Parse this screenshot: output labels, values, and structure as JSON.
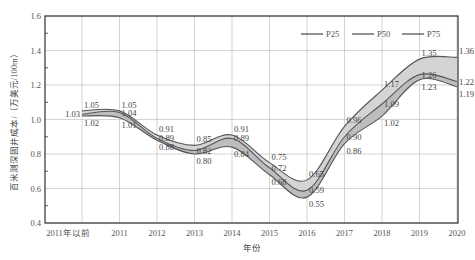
{
  "chart_data": {
    "type": "area",
    "title": "",
    "xlabel": "年份",
    "ylabel": "百米测深固井成本/（万美元/100m）",
    "categories": [
      "2011年以前",
      "2011",
      "2012",
      "2013",
      "2014",
      "2015",
      "2016",
      "2017",
      "2018",
      "2019",
      "2020"
    ],
    "series": [
      {
        "name": "P25",
        "values": [
          1.02,
          1.01,
          0.88,
          0.8,
          0.84,
          0.68,
          0.55,
          0.86,
          1.02,
          1.23,
          1.19
        ]
      },
      {
        "name": "P50",
        "values": [
          1.03,
          1.04,
          0.89,
          0.82,
          0.89,
          0.72,
          0.59,
          0.9,
          1.09,
          1.26,
          1.22
        ]
      },
      {
        "name": "P75",
        "values": [
          1.05,
          1.05,
          0.91,
          0.85,
          0.91,
          0.75,
          0.65,
          0.96,
          1.17,
          1.35,
          1.36
        ]
      }
    ],
    "ylim": [
      0.4,
      1.6
    ],
    "yticks": [
      "0.4",
      "0.6",
      "0.8",
      "1.0",
      "1.2",
      "1.4",
      "1.6"
    ],
    "grid": true,
    "legend_position": "top-right"
  },
  "legend": {
    "items": [
      {
        "label": "P25"
      },
      {
        "label": "P50"
      },
      {
        "label": "P75"
      }
    ]
  },
  "axes": {
    "x_title": "年份",
    "y_title": "百米测深固井成本/（万美元/100m）"
  },
  "colors": {
    "line": "#555555",
    "band_upper": "#d4d4d4",
    "band_lower": "#bdbdbd",
    "grid": "#c8c8c8",
    "axis": "#333333"
  }
}
